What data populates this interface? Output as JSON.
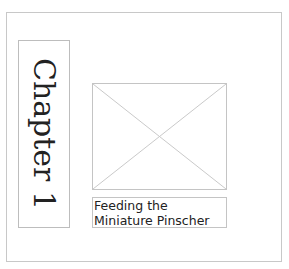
{
  "page": {
    "chapter_label": "Chapter 1",
    "caption_line1": "Feeding the",
    "caption_line2": "Miniature Pinscher",
    "image_placeholder_icon": "image-placeholder-icon"
  },
  "colors": {
    "border": "#c4c4c4",
    "text": "#222222",
    "background": "#ffffff"
  }
}
